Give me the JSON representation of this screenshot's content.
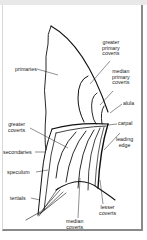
{
  "diagram": {
    "labels": {
      "primaries": "primaries",
      "greater_primary_coverts": "greater\nprimary\ncoverts",
      "median_primary_coverts": "median\nprimary\ncoverts",
      "alula": "alula",
      "carpal": "carpal",
      "leading_edge": "leading\nedge",
      "greater_coverts": "greater\ncoverts",
      "secondaries": "secondaries",
      "speculum": "speculum",
      "tertials": "tertials",
      "median_coverts": "median\ncoverts",
      "lesser_coverts": "lesser\ncoverts"
    },
    "colors": {
      "line": "#111111",
      "text": "#222222",
      "frame": "#8a8a8a"
    }
  }
}
